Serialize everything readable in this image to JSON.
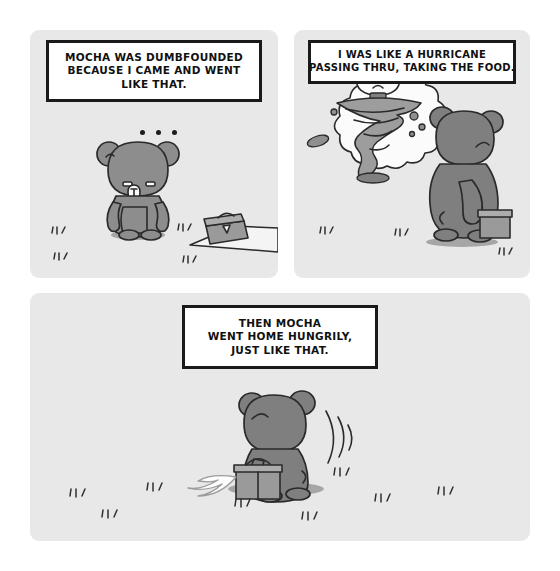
{
  "comic": {
    "title": "Mocha bear comic strip",
    "background_color": "#ffffff",
    "panel_color": "#e8e8e8",
    "ink_color": "#2a2a2a",
    "character_color": "#8d8d8d",
    "panels": [
      {
        "id": "panel-1",
        "caption_lines": [
          "MOCHA WAS DUMBFOUNDED",
          "BECAUSE I CAME AND WENT",
          "LIKE THAT."
        ],
        "ellipsis": "• • •",
        "scene": "Gray bear stands facing forward with blank expression; a lunchbox sits on a picnic mat to the right; grass tufts on the ground."
      },
      {
        "id": "panel-2",
        "caption_lines": [
          "I WAS LIKE A HURRICANE",
          "PASSING THRU, TAKING THE FOOD."
        ],
        "scene": "Bear seen from behind beside the lunchbox, imagining a thought bubble containing an angry white bear riding a tornado that flings debris."
      },
      {
        "id": "panel-3",
        "caption_lines": [
          "THEN MOCHA",
          "WENT HOME HUNGRILY,",
          "JUST LIKE THAT."
        ],
        "scene": "Bear walks away from the viewer carrying the lunchbox, with motion arcs and a trailing white cloth; grass tufts scattered across the field."
      }
    ]
  }
}
